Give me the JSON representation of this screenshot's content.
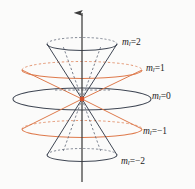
{
  "figure": {
    "kind": "space-quantization-cone-diagram",
    "background_color": "#fbfbfa",
    "axis": {
      "name": "z-axis-arrow",
      "color": "#3c3c3c",
      "x": 82,
      "y_top": 12,
      "y_bottom": 182
    },
    "origin": {
      "x": 82,
      "y": 99,
      "dot_color": "#d2502a"
    },
    "colors": {
      "dark": "#3f4653",
      "orange": "#de7a4c",
      "axis": "#3c3c3c",
      "text": "#1d1d1d",
      "dashed_dark": "#5b6272",
      "dashed_orange": "#e08a63"
    },
    "labels": [
      {
        "id": "ml2",
        "symbol": "m",
        "subscript": "l",
        "equals": "=",
        "value": "2",
        "text": "m_l=2",
        "color": "#1d1d1d"
      },
      {
        "id": "ml1",
        "symbol": "m",
        "subscript": "l",
        "equals": "=",
        "value": "1",
        "text": "m_l=1",
        "color": "#1d1d1d"
      },
      {
        "id": "ml0",
        "symbol": "m",
        "subscript": "l",
        "equals": "=",
        "value": "0",
        "text": "m_l=0",
        "color": "#1d1d1d"
      },
      {
        "id": "mlneg1",
        "symbol": "m",
        "subscript": "l",
        "equals": "=",
        "value": "−1",
        "text": "m_l=-1",
        "color": "#1d1d1d"
      },
      {
        "id": "mlneg2",
        "symbol": "m",
        "subscript": "l",
        "equals": "=",
        "value": "−2",
        "text": "m_l=-2",
        "color": "#1d1d1d"
      }
    ],
    "cones": [
      {
        "id": "ml2",
        "m_value": 2,
        "rim_cy": 44,
        "rim_rx": 35,
        "rim_ry": 6.5,
        "color": "#3f4653",
        "orientation": "up"
      },
      {
        "id": "ml1",
        "m_value": 1,
        "rim_cy": 70,
        "rim_rx": 60,
        "rim_ry": 8.5,
        "color": "#de7a4c",
        "orientation": "up"
      },
      {
        "id": "ml0",
        "m_value": 0,
        "rim_cy": 99,
        "rim_rx": 69,
        "rim_ry": 11.0,
        "color": "#3f4653",
        "orientation": "flat"
      },
      {
        "id": "mlneg1",
        "m_value": -1,
        "rim_cy": 129,
        "rim_rx": 60,
        "rim_ry": 8.5,
        "color": "#de7a4c",
        "orientation": "down"
      },
      {
        "id": "mlneg2",
        "m_value": -2,
        "rim_cy": 155,
        "rim_rx": 35,
        "rim_ry": 6.5,
        "color": "#3f4653",
        "orientation": "down"
      }
    ]
  }
}
